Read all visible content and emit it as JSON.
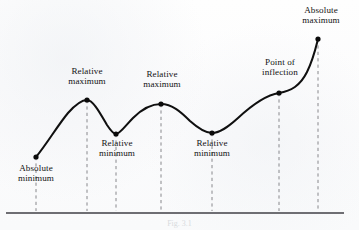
{
  "figure": {
    "caption": "Fig. 3.1",
    "background_color": "#fdfdfd",
    "curve_color": "#101010",
    "axis_color": "#6e6e73",
    "dash_color": "#7b7b80",
    "marker_color": "#0b0b0b"
  },
  "axis": {
    "baseline_y": 213,
    "x_start": 6,
    "x_end": 344
  },
  "chart_data": {
    "type": "line",
    "xlabel": "",
    "ylabel": "",
    "grid": false,
    "legend_position": "none",
    "axis_ranges": {
      "x": [
        0,
        359
      ],
      "y_screen_top": 0,
      "y_screen_baseline": 213
    },
    "note": "Screen coordinates: y increases downward. Higher curve value = smaller y.",
    "points": [
      {
        "label": "Absolute minimum",
        "x": 36,
        "y": 157,
        "kind": "absolute-minimum"
      },
      {
        "label": "Relative maximum",
        "x": 87,
        "y": 100,
        "kind": "relative-maximum"
      },
      {
        "label": "Relative minimum",
        "x": 116,
        "y": 134,
        "kind": "relative-minimum"
      },
      {
        "label": "Relative maximum",
        "x": 161,
        "y": 104,
        "kind": "relative-maximum"
      },
      {
        "label": "Relative minimum",
        "x": 212,
        "y": 133,
        "kind": "relative-minimum"
      },
      {
        "label": "Point of inflection",
        "x": 279,
        "y": 93,
        "kind": "inflection"
      },
      {
        "label": "Absolute maximum",
        "x": 318,
        "y": 39,
        "kind": "absolute-maximum"
      }
    ],
    "curve_path": "M 36,157 C 46,145 58,125 68,113 C 76,104 82,100 87,100 C 93,100 100,113 107,125 C 111,131 114,134 116,134 C 120,134 126,125 133,118 C 142,109 152,104 161,104 C 172,104 181,112 190,121 C 199,129 206,133 212,133 C 220,133 228,127 238,118 C 252,105 266,95 279,93 C 291,91 300,86 307,72 C 313,60 316,47 318,39"
  },
  "labels": [
    {
      "name": "absolute-minimum-label",
      "text": "Absolute\nminimum",
      "left": 6,
      "top": 163,
      "width": 60
    },
    {
      "name": "relative-maximum-1-label",
      "text": "Relative\nmaximum",
      "left": 55,
      "top": 66,
      "width": 64
    },
    {
      "name": "relative-minimum-1-label",
      "text": "Relative\nminimum",
      "left": 87,
      "top": 138,
      "width": 60
    },
    {
      "name": "relative-maximum-2-label",
      "text": "Relative\nmaximum",
      "left": 130,
      "top": 69,
      "width": 64
    },
    {
      "name": "relative-minimum-2-label",
      "text": "Relative\nminimum",
      "left": 182,
      "top": 138,
      "width": 60
    },
    {
      "name": "point-of-inflection-label",
      "text": "Point of\ninflection",
      "left": 249,
      "top": 57,
      "width": 62
    },
    {
      "name": "absolute-maximum-label",
      "text": "Absolute\nmaximum",
      "left": 288,
      "top": 5,
      "width": 66
    }
  ]
}
